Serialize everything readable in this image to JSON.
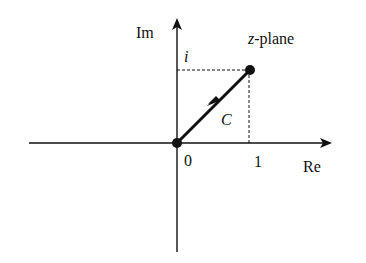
{
  "diagram": {
    "title": "z-plane",
    "title_italic_part": "z",
    "title_rest": "-plane",
    "axes": {
      "x_label": "Re",
      "y_label": "Im",
      "origin_label": "0",
      "x_tick_label": "1",
      "y_tick_label": "i"
    },
    "curve": {
      "label": "C",
      "from": [
        0,
        0
      ],
      "to": [
        1,
        1
      ],
      "description": "Straight line segment from 0 to 1+i with direction arrow"
    },
    "colors": {
      "line": "#111111",
      "background": "#ffffff"
    }
  }
}
